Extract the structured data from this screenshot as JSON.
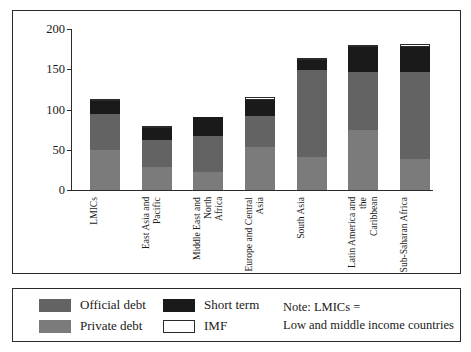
{
  "chart_data": {
    "type": "bar",
    "title": "",
    "subtitle": "",
    "xlabel": "",
    "ylabel": "",
    "ylim": [
      0,
      200
    ],
    "yticks": [
      0,
      50,
      100,
      150,
      200
    ],
    "ytick_labels": [
      "0",
      "50",
      "100",
      "150",
      "200"
    ],
    "grid": false,
    "stacked": true,
    "legend_position": "bottom-left",
    "categories": [
      "LMICs",
      "East Asia and Pacific",
      "Middle East and North\nAfrica",
      "Europe and Central\nAsia",
      "South Asia",
      "Latin America and the\nCaribbean",
      "Sub-Saharan Africa"
    ],
    "series": [
      {
        "name": "Private debt",
        "color": "#7b7b7b",
        "values": [
          50,
          28,
          22,
          54,
          41,
          75,
          38
        ]
      },
      {
        "name": "Official debt",
        "color": "#636363",
        "values": [
          44,
          34,
          45,
          38,
          108,
          71,
          108
        ]
      },
      {
        "name": "Short term",
        "color": "#1a1a1a",
        "values": [
          16,
          15,
          24,
          20,
          12,
          32,
          32
        ]
      },
      {
        "name": "IMF",
        "color": "#ffffff",
        "values": [
          2,
          2,
          0,
          3,
          2,
          2,
          4
        ]
      }
    ],
    "totals": [
      112,
      79,
      91,
      115,
      163,
      180,
      182
    ],
    "annotations": [
      "Note: LMICs =",
      "Low and middle income countries"
    ]
  },
  "legend": {
    "items": [
      {
        "label": "Official debt",
        "swatch": "official"
      },
      {
        "label": "Short term",
        "swatch": "short"
      },
      {
        "label": "Private debt",
        "swatch": "private"
      },
      {
        "label": "IMF",
        "swatch": "imf"
      }
    ]
  },
  "note": {
    "text": "Note: LMICs =\nLow and middle income countries"
  }
}
